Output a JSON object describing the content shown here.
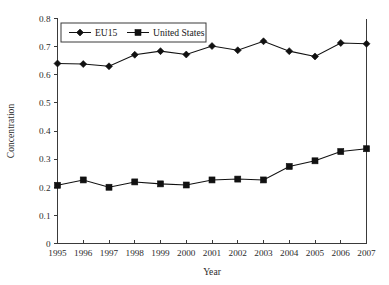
{
  "chart_data": {
    "type": "line",
    "title": "",
    "xlabel": "Year",
    "ylabel": "Concentration",
    "x": [
      1995,
      1996,
      1997,
      1998,
      1999,
      2000,
      2001,
      2002,
      2003,
      2004,
      2005,
      2006,
      2007
    ],
    "categories": [
      "1995",
      "1996",
      "1997",
      "1998",
      "1999",
      "2000",
      "2001",
      "2002",
      "2003",
      "2004",
      "2005",
      "2006",
      "2007"
    ],
    "xlim": [
      1995,
      2007
    ],
    "ylim": [
      0,
      0.8
    ],
    "y_ticks": [
      0,
      0.1,
      0.2,
      0.3,
      0.4,
      0.5,
      0.6,
      0.7,
      0.8
    ],
    "y_tick_labels": [
      "0",
      "0.1",
      "0.2",
      "0.3",
      "0.4",
      "0.5",
      "0.6",
      "0.7",
      "0.8"
    ],
    "x_tick_labels": [
      "1995",
      "1996",
      "1997",
      "1998",
      "1999",
      "2000",
      "2001",
      "2002",
      "2003",
      "2004",
      "2005",
      "2006",
      "2007"
    ],
    "grid": false,
    "legend_position": "top-left-inside",
    "series": [
      {
        "name": "EU15",
        "marker": "diamond",
        "color": "#111111",
        "values": [
          0.64,
          0.638,
          0.63,
          0.671,
          0.684,
          0.672,
          0.702,
          0.687,
          0.719,
          0.684,
          0.665,
          0.713,
          0.71
        ]
      },
      {
        "name": "United States",
        "marker": "square",
        "color": "#111111",
        "values": [
          0.207,
          0.226,
          0.2,
          0.219,
          0.212,
          0.208,
          0.226,
          0.229,
          0.226,
          0.274,
          0.294,
          0.327,
          0.337
        ]
      }
    ]
  },
  "axis": {
    "y_label": "Concentration",
    "x_label": "Year"
  },
  "legend": {
    "entries": [
      {
        "label": "EU15",
        "marker": "diamond"
      },
      {
        "label": "United States",
        "marker": "square"
      }
    ]
  },
  "colors": {
    "series_ink": "#111111",
    "axis_ink": "#3a3a3a",
    "background": "#ffffff"
  },
  "caption_fragment": ""
}
